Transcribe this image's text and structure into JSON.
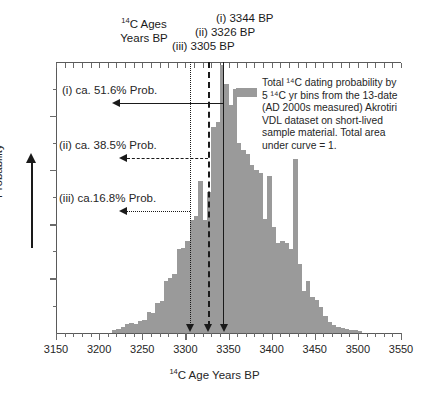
{
  "figure": {
    "header": {
      "ages_label_line1_pre": "",
      "ages_label_line1": "C Ages",
      "ages_label_line2": "Years BP",
      "sup": "14",
      "markers": [
        {
          "id": "i",
          "label": "(i) 3344 BP",
          "value": 3344,
          "style": "solid"
        },
        {
          "id": "ii",
          "label": "(ii) 3326 BP",
          "value": 3326,
          "style": "dashed"
        },
        {
          "id": "iii",
          "label": "(iii) 3305 BP",
          "value": 3305,
          "style": "dotted"
        }
      ]
    },
    "probability_annotations": [
      {
        "id": "i",
        "label": "(i) ca. 51.6% Prob.",
        "percent": 51.6,
        "style": "solid",
        "from_value": 3344,
        "to_value": 3224
      },
      {
        "id": "ii",
        "label": "(ii) ca. 38.5% Prob.",
        "percent": 38.5,
        "style": "dashed",
        "from_value": 3326,
        "to_value": 3232
      },
      {
        "id": "iii",
        "label": "(iii) ca.16.8% Prob.",
        "percent": 16.8,
        "style": "dotted",
        "from_value": 3305,
        "to_value": 3232
      }
    ],
    "legend": {
      "swatch_color": "#9a9a9a",
      "lines": [
        "Total ¹⁴C dating probability by",
        "5 ¹⁴C yr bins from the 13-date",
        "(AD 2000s measured) Akrotiri",
        "VDL dataset on short-lived",
        "sample material. Total area",
        "under curve = 1."
      ]
    },
    "yaxis": {
      "title": "Probability",
      "arrow": "up"
    },
    "xaxis": {
      "title_pre": "",
      "title": "C Age Years BP",
      "sup": "14",
      "ticks": [
        3150,
        3200,
        3250,
        3300,
        3350,
        3400,
        3450,
        3500,
        3550
      ],
      "minor_step": 10
    }
  },
  "chart_data": {
    "type": "bar",
    "title": "",
    "subtitle": "",
    "xlabel": "14C Age Years BP",
    "ylabel": "Probability",
    "xlim": [
      3150,
      3550
    ],
    "ylim": [
      0,
      1.0
    ],
    "bin_width": 5,
    "grid": false,
    "legend_position": "top-right",
    "bar_color": "#9a9a9a",
    "series": [
      {
        "name": "Total 14C dating probability by 5 14C yr bins (13-date Akrotiri VDL dataset)",
        "x": [
          3215,
          3220,
          3225,
          3230,
          3235,
          3240,
          3245,
          3250,
          3255,
          3260,
          3265,
          3270,
          3275,
          3280,
          3285,
          3290,
          3295,
          3300,
          3305,
          3310,
          3315,
          3320,
          3325,
          3330,
          3335,
          3340,
          3345,
          3350,
          3355,
          3360,
          3365,
          3370,
          3375,
          3380,
          3385,
          3390,
          3395,
          3400,
          3405,
          3410,
          3415,
          3420,
          3425,
          3430,
          3435,
          3440,
          3445,
          3450,
          3455,
          3460,
          3465,
          3470,
          3475,
          3480,
          3485,
          3490,
          3495,
          3500
        ],
        "values": [
          0.01,
          0.014,
          0.02,
          0.03,
          0.034,
          0.03,
          0.042,
          0.046,
          0.075,
          0.072,
          0.11,
          0.118,
          0.19,
          0.2,
          0.215,
          0.31,
          0.312,
          0.34,
          0.415,
          0.43,
          0.56,
          0.415,
          0.52,
          0.76,
          0.78,
          0.99,
          0.92,
          0.84,
          0.9,
          0.7,
          0.675,
          0.66,
          0.62,
          0.6,
          0.59,
          0.42,
          0.58,
          0.39,
          0.33,
          0.34,
          0.33,
          0.31,
          0.64,
          0.255,
          0.155,
          0.19,
          0.13,
          0.12,
          0.095,
          0.06,
          0.04,
          0.028,
          0.022,
          0.018,
          0.014,
          0.01,
          0.008,
          0.006
        ]
      }
    ],
    "vertical_markers": [
      {
        "label": "(i) 3344 BP",
        "value": 3344,
        "style": "solid"
      },
      {
        "label": "(ii) 3326 BP",
        "value": 3326,
        "style": "dashed"
      },
      {
        "label": "(iii) 3305 BP",
        "value": 3305,
        "style": "dotted"
      }
    ],
    "annotations": [
      {
        "text": "(i) ca. 51.6% Prob.",
        "value": 51.6
      },
      {
        "text": "(ii) ca. 38.5% Prob.",
        "value": 38.5
      },
      {
        "text": "(iii) ca.16.8% Prob.",
        "value": 16.8
      }
    ]
  }
}
